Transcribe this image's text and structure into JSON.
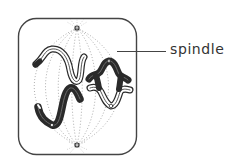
{
  "diagram": {
    "labels": [
      {
        "id": "spindle",
        "text": "spindle"
      }
    ],
    "elements": {
      "cell_outline": "rounded square cell membrane",
      "spindle_poles": [
        "top pole",
        "bottom pole"
      ],
      "spindle_fibres": "dotted arcs connecting the two poles",
      "bivalents": [
        {
          "id": "left-bivalent",
          "shape": "X-shaped chiasma",
          "colors": [
            "outlined (white)",
            "solid (black)"
          ]
        },
        {
          "id": "right-bivalent",
          "shape": "ring bivalent",
          "colors": [
            "solid (black)",
            "outlined (white)"
          ]
        }
      ]
    },
    "colors": {
      "ink": "#2a2a2a",
      "outline": "#444444",
      "spindle": "#9a9a9a",
      "background": "#ffffff",
      "label": "#333333"
    }
  }
}
